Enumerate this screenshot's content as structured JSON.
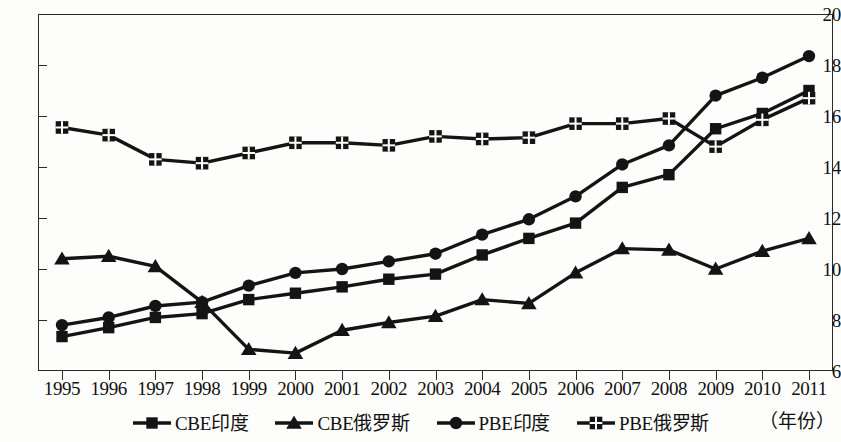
{
  "chart_data": {
    "type": "line",
    "title": "",
    "xlabel": "（年份）",
    "ylabel": "",
    "ylim": [
      6,
      20
    ],
    "ytick_values": [
      6,
      8,
      10,
      12,
      14,
      16,
      18,
      20
    ],
    "ytick_labels": [
      "6",
      "8",
      "10",
      "12",
      "14",
      "16",
      "18",
      "20"
    ],
    "grid": false,
    "legend_position": "bottom",
    "categories": [
      "1995",
      "1996",
      "1997",
      "1998",
      "1999",
      "2000",
      "2001",
      "2002",
      "2003",
      "2004",
      "2005",
      "2006",
      "2007",
      "2008",
      "2009",
      "2010",
      "2011"
    ],
    "series": [
      {
        "name": "CBE印度",
        "marker": "square",
        "color": "#141414",
        "values": [
          7.35,
          7.7,
          8.1,
          8.25,
          8.8,
          9.05,
          9.3,
          9.6,
          9.8,
          10.55,
          11.2,
          11.8,
          13.2,
          13.7,
          15.5,
          16.1,
          17.0
        ]
      },
      {
        "name": "CBE俄罗斯",
        "marker": "triangle",
        "color": "#141414",
        "values": [
          10.4,
          10.5,
          10.1,
          8.7,
          6.85,
          6.7,
          7.6,
          7.9,
          8.15,
          8.8,
          8.65,
          9.85,
          10.8,
          10.75,
          10.0,
          10.7,
          11.2
        ]
      },
      {
        "name": "PBE印度",
        "marker": "circle",
        "color": "#141414",
        "values": [
          7.8,
          8.1,
          8.55,
          8.7,
          9.35,
          9.85,
          10.0,
          10.3,
          10.6,
          11.35,
          11.95,
          12.85,
          14.1,
          14.85,
          16.8,
          17.5,
          18.35
        ]
      },
      {
        "name": "PBE俄罗斯",
        "marker": "square-cross",
        "color": "#141414",
        "values": [
          15.55,
          15.25,
          14.3,
          14.15,
          14.55,
          14.95,
          14.95,
          14.85,
          15.2,
          15.1,
          15.15,
          15.7,
          15.7,
          15.9,
          14.8,
          15.85,
          16.7
        ]
      }
    ]
  },
  "legend": {
    "items": [
      {
        "label": "CBE印度",
        "marker": "square"
      },
      {
        "label": "CBE俄罗斯",
        "marker": "triangle"
      },
      {
        "label": "PBE印度",
        "marker": "circle"
      },
      {
        "label": "PBE俄罗斯",
        "marker": "square-cross"
      }
    ]
  },
  "axis_unit_label": "（年份）"
}
